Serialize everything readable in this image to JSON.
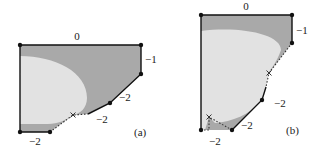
{
  "colors": {
    "dark_region": "#a9a9a9",
    "light_region": "#e2e2e2",
    "edge": "#111111",
    "background": "#ffffff"
  },
  "panels": [
    {
      "caption": "(a)",
      "edge_labels": {
        "top": "0",
        "right": "−1",
        "slope_upper": "−2",
        "slope_lower": "−2",
        "bottom": "−2"
      },
      "vertices": [
        [
          20,
          45
        ],
        [
          141,
          45
        ],
        [
          141,
          74
        ],
        [
          110,
          103
        ],
        [
          88,
          114
        ],
        [
          50,
          132
        ],
        [
          20,
          132
        ]
      ],
      "marks": [
        {
          "type": "cross",
          "at": [
            73,
            115
          ]
        }
      ]
    },
    {
      "caption": "(b)",
      "edge_labels": {
        "top": "0",
        "right": "−1",
        "slope_upper": "−2",
        "slope_lower": "−2",
        "bottom": "−2"
      },
      "vertices": [
        [
          201,
          15
        ],
        [
          292,
          15
        ],
        [
          292,
          43
        ],
        [
          262,
          100
        ],
        [
          232,
          130
        ],
        [
          201,
          130
        ]
      ],
      "marks": [
        {
          "type": "cross",
          "at": [
            269,
            73
          ]
        },
        {
          "type": "cross",
          "at": [
            209,
            117
          ]
        }
      ]
    }
  ]
}
